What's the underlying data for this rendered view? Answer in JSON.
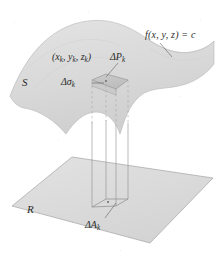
{
  "figure": {
    "kind": "3d-math-diagram",
    "colors": {
      "surface_fill": "#dcdcdc",
      "surface_stroke": "#b4b4b4",
      "plane_fill": "#dedede",
      "plane_stroke": "#9a9a9a",
      "patch_fill": "#c6c6c6",
      "patch_stroke": "#8f8f8f",
      "line": "#8a8a8a",
      "dashed_line": "#a6a6a6",
      "text": "#2b2b2b",
      "background": "#ffffff"
    }
  },
  "labels": {
    "level_set": "f(x, y, z) = c",
    "sample_point": "(x",
    "sample_point_sub1": "k",
    "sample_point_mid1": ", y",
    "sample_point_sub2": "k",
    "sample_point_mid2": ", z",
    "sample_point_sub3": "k",
    "sample_point_end": ")",
    "delta_p": "ΔP",
    "delta_p_sub": "k",
    "delta_sigma": "Δσ",
    "delta_sigma_sub": "k",
    "surface": "S",
    "region": "R",
    "delta_a": "ΔA",
    "delta_a_sub": "k"
  }
}
